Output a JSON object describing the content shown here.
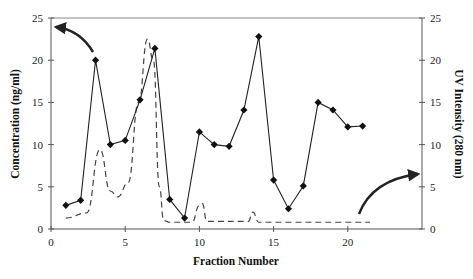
{
  "chart_data": {
    "type": "line",
    "title": "",
    "xlabel": "Fraction Number",
    "ylabel": "Concentration (ng/ml)",
    "y2label": "UV Intensity (280 nm)",
    "xlim": [
      0,
      25
    ],
    "ylim": [
      0,
      25
    ],
    "y2lim": [
      0,
      25
    ],
    "x_ticks": [
      0,
      5,
      10,
      15,
      20
    ],
    "y_ticks": [
      0,
      5,
      10,
      15,
      20,
      25
    ],
    "y2_ticks": [
      0,
      5,
      10,
      15,
      20,
      25
    ],
    "grid": false,
    "legend": "none",
    "series": [
      {
        "name": "Concentration (ng/ml)",
        "axis": "left",
        "style": "solid line with diamond markers",
        "x": [
          1,
          2,
          3,
          4,
          5,
          6,
          7,
          8,
          9,
          10,
          11,
          12,
          13,
          14,
          15,
          16,
          17,
          18,
          19,
          20,
          21
        ],
        "values": [
          2.8,
          3.4,
          20.0,
          10.0,
          10.5,
          15.3,
          21.4,
          3.5,
          1.3,
          11.5,
          10.0,
          9.8,
          14.1,
          22.8,
          5.8,
          2.4,
          5.1,
          15.0,
          14.1,
          12.1,
          12.2
        ]
      },
      {
        "name": "UV Intensity (280 nm)",
        "axis": "right",
        "style": "dashed line",
        "x": [
          1,
          2.4,
          3.3,
          4.0,
          4.5,
          5.2,
          5.9,
          6.5,
          6.9,
          7.3,
          7.6,
          8.0,
          9.5,
          10.0,
          10.2,
          10.5,
          13.3,
          13.6,
          14.0,
          21.5
        ],
        "values": [
          1.3,
          1.9,
          9.4,
          4.5,
          3.8,
          5.5,
          15.0,
          22.5,
          20.0,
          5.0,
          1.0,
          0.8,
          0.8,
          2.8,
          3.0,
          0.9,
          0.9,
          2.0,
          0.8,
          0.8
        ]
      }
    ],
    "annotations": [
      {
        "type": "arrow",
        "description": "curved arrow pointing to left axis (Concentration)"
      },
      {
        "type": "arrow",
        "description": "curved arrow pointing to right axis (UV Intensity)"
      }
    ]
  }
}
